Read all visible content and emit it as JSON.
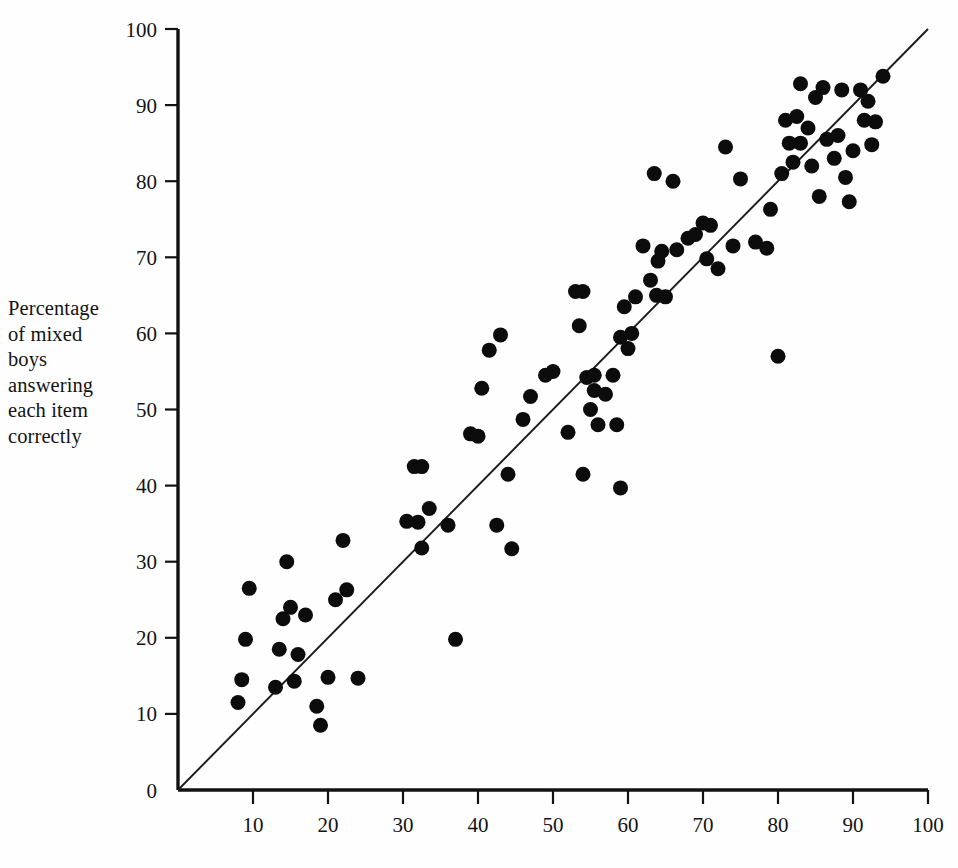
{
  "figure": {
    "background_color": "#fefefe",
    "ink_color": "#111111"
  },
  "axis_label": {
    "y_lines": [
      "Percentage",
      "of mixed",
      "boys",
      "answering",
      "each item",
      "correctly"
    ]
  },
  "chart_data": {
    "type": "scatter",
    "title": "",
    "xlabel": "",
    "ylabel": "Percentage of mixed boys answering each item correctly",
    "xlim": [
      0,
      100
    ],
    "ylim": [
      0,
      100
    ],
    "grid": false,
    "legend": null,
    "x_ticks": [
      0,
      10,
      20,
      30,
      40,
      50,
      60,
      70,
      80,
      90,
      100
    ],
    "x_tick_labels": [
      "",
      "10",
      "20",
      "30",
      "40",
      "50",
      "60",
      "70",
      "80",
      "90",
      "100"
    ],
    "y_ticks": [
      0,
      10,
      20,
      30,
      40,
      50,
      60,
      70,
      80,
      90,
      100
    ],
    "y_tick_labels": [
      "0",
      "10",
      "20",
      "30",
      "40",
      "50",
      "60",
      "70",
      "80",
      "90",
      "100"
    ],
    "reference_line": {
      "description": "identity line y = x",
      "from": [
        0,
        0
      ],
      "to": [
        100,
        100
      ]
    },
    "marker": {
      "shape": "circle",
      "color": "#0c0c0c",
      "radius_px": 7.5
    },
    "points": [
      [
        8,
        11.5
      ],
      [
        8.5,
        14.5
      ],
      [
        9,
        19.8
      ],
      [
        9.5,
        26.5
      ],
      [
        13,
        13.5
      ],
      [
        13.5,
        18.5
      ],
      [
        14,
        22.5
      ],
      [
        14.5,
        30
      ],
      [
        15,
        24
      ],
      [
        15.5,
        14.3
      ],
      [
        16,
        17.8
      ],
      [
        17,
        23
      ],
      [
        18.5,
        11
      ],
      [
        19,
        8.5
      ],
      [
        20,
        14.8
      ],
      [
        21,
        25
      ],
      [
        22,
        32.8
      ],
      [
        22.5,
        26.3
      ],
      [
        24,
        14.7
      ],
      [
        30.5,
        35.3
      ],
      [
        31.5,
        42.5
      ],
      [
        32.5,
        42.5
      ],
      [
        32,
        35.2
      ],
      [
        32.5,
        31.8
      ],
      [
        33.5,
        37
      ],
      [
        36,
        34.8
      ],
      [
        37,
        19.8
      ],
      [
        39,
        46.8
      ],
      [
        40,
        46.5
      ],
      [
        40.5,
        52.8
      ],
      [
        41.5,
        57.8
      ],
      [
        42.5,
        34.8
      ],
      [
        43,
        59.8
      ],
      [
        44,
        41.5
      ],
      [
        44.5,
        31.7
      ],
      [
        46,
        48.7
      ],
      [
        47,
        51.7
      ],
      [
        49,
        54.5
      ],
      [
        50,
        55
      ],
      [
        52,
        47
      ],
      [
        53,
        65.5
      ],
      [
        54,
        65.5
      ],
      [
        53.5,
        61
      ],
      [
        54,
        41.5
      ],
      [
        54.5,
        54.2
      ],
      [
        55,
        50
      ],
      [
        55.5,
        52.5
      ],
      [
        55.5,
        54.5
      ],
      [
        56,
        48
      ],
      [
        57,
        52
      ],
      [
        58,
        54.5
      ],
      [
        58.5,
        48
      ],
      [
        59,
        39.7
      ],
      [
        59,
        59.5
      ],
      [
        59.5,
        63.5
      ],
      [
        60,
        58
      ],
      [
        60.5,
        60
      ],
      [
        61,
        64.8
      ],
      [
        62,
        71.5
      ],
      [
        63,
        67
      ],
      [
        63.5,
        81
      ],
      [
        63.8,
        65
      ],
      [
        64,
        69.5
      ],
      [
        64.5,
        70.8
      ],
      [
        65,
        64.8
      ],
      [
        66,
        80
      ],
      [
        66.5,
        71
      ],
      [
        68,
        72.5
      ],
      [
        69,
        73
      ],
      [
        70,
        74.5
      ],
      [
        70.5,
        69.8
      ],
      [
        71,
        74.2
      ],
      [
        72,
        68.5
      ],
      [
        73,
        84.5
      ],
      [
        74,
        71.5
      ],
      [
        75,
        80.3
      ],
      [
        77,
        72
      ],
      [
        78.5,
        71.2
      ],
      [
        79,
        76.3
      ],
      [
        80,
        57
      ],
      [
        80.5,
        81
      ],
      [
        81,
        88
      ],
      [
        81.5,
        85
      ],
      [
        82,
        82.5
      ],
      [
        82.5,
        88.5
      ],
      [
        83,
        85
      ],
      [
        83,
        92.8
      ],
      [
        84,
        87
      ],
      [
        84.5,
        82
      ],
      [
        85,
        91
      ],
      [
        85.5,
        78
      ],
      [
        86,
        92.3
      ],
      [
        86.5,
        85.5
      ],
      [
        87.5,
        83
      ],
      [
        88,
        86
      ],
      [
        88.5,
        92
      ],
      [
        89,
        80.5
      ],
      [
        89.5,
        77.3
      ],
      [
        90,
        84
      ],
      [
        91,
        92
      ],
      [
        91.5,
        88
      ],
      [
        92,
        90.5
      ],
      [
        92.5,
        84.8
      ],
      [
        93,
        87.8
      ],
      [
        94,
        93.8
      ]
    ]
  }
}
